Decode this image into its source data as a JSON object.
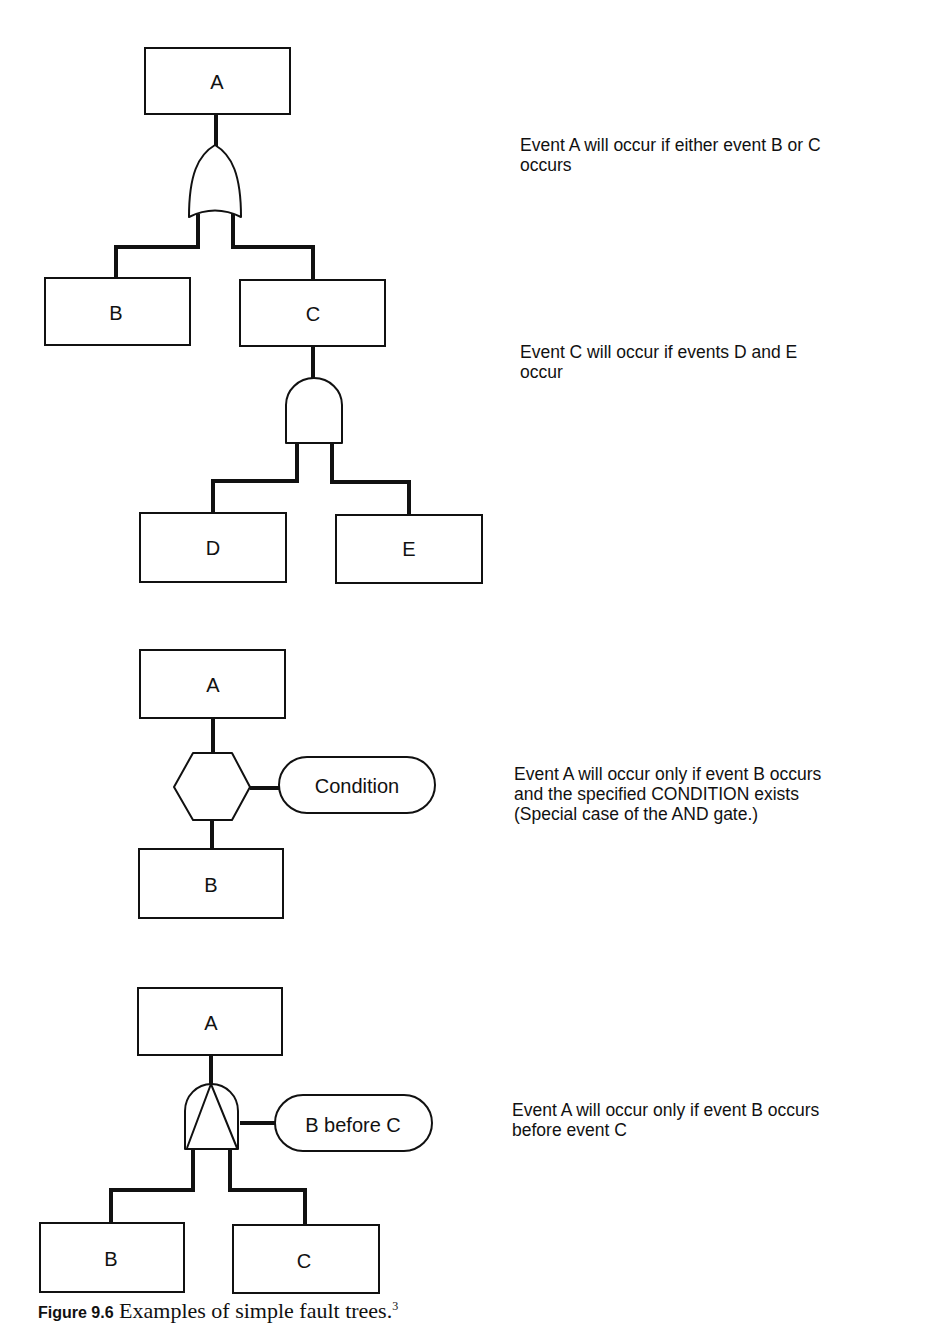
{
  "diagrams": [
    {
      "id": "or-gate-example",
      "gate_type": "OR",
      "events": {
        "top": "A",
        "left": "B",
        "right": "C"
      },
      "description": "Event A will occur if either event B or C\noccurs"
    },
    {
      "id": "and-gate-example",
      "gate_type": "AND",
      "events": {
        "top": "C",
        "left": "D",
        "right": "E"
      },
      "description": "Event C will occur if events D and E\noccur"
    },
    {
      "id": "inhibit-gate-example",
      "gate_type": "INHIBIT",
      "events": {
        "top": "A",
        "bottom": "B"
      },
      "condition": "Condition",
      "description": "Event A will occur only if event B occurs\nand the specified CONDITION exists\n(Special case of the AND gate.)"
    },
    {
      "id": "priority-and-gate-example",
      "gate_type": "PRIORITY AND",
      "events": {
        "top": "A",
        "left": "B",
        "right": "C"
      },
      "condition": "B before C",
      "description": "Event A will occur only if event B occurs\nbefore event C"
    }
  ],
  "caption": {
    "label": "Figure 9.6",
    "text": "Examples of simple fault trees.",
    "footnote": "3"
  }
}
